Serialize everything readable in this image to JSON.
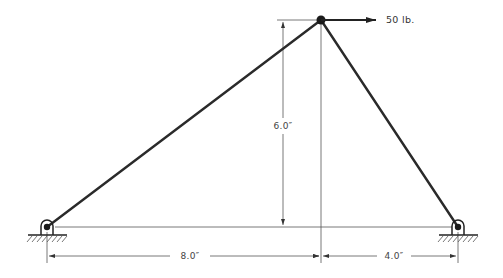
{
  "diagram": {
    "type": "truss-free-body",
    "members": [
      {
        "name": "left-member",
        "from": "left-support",
        "to": "apex"
      },
      {
        "name": "right-member",
        "from": "apex",
        "to": "right-support"
      }
    ],
    "joints": {
      "apex": {
        "x": 321,
        "y": 20
      },
      "left_support": {
        "x": 47,
        "y": 227
      },
      "right_support": {
        "x": 458,
        "y": 227
      }
    },
    "load": {
      "label": "50 lb.",
      "direction": "right",
      "color": "#2a2a2a"
    },
    "dimensions": {
      "height": "6.0″",
      "left_span": "8.0″",
      "right_span": "4.0″"
    },
    "supports": [
      {
        "name": "left-pin-support",
        "type": "pin"
      },
      {
        "name": "right-pin-support",
        "type": "pin"
      }
    ],
    "colors": {
      "member": "#2a2a2a",
      "dimension": "#555555",
      "background": "#ffffff"
    }
  }
}
